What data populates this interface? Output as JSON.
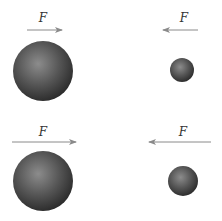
{
  "diagram": {
    "force_label": "F",
    "colors": {
      "background": "#ffffff",
      "arrow": "#8a8a8a",
      "label": "#333333",
      "sphere_light": "#8c8c8c",
      "sphere_mid": "#555555",
      "sphere_dark": "#2a2a2a"
    },
    "panels": [
      {
        "id": "top-left",
        "label": "F",
        "arrow": {
          "x1": 27,
          "x2": 62,
          "y": 30,
          "direction": "right"
        },
        "label_pos": {
          "x": 43,
          "y": 22
        },
        "sphere": {
          "cx": 43,
          "cy": 71,
          "r": 30,
          "size": "large"
        }
      },
      {
        "id": "top-right",
        "label": "F",
        "arrow": {
          "x1": 198,
          "x2": 163,
          "y": 30,
          "direction": "left"
        },
        "label_pos": {
          "x": 183,
          "y": 22
        },
        "sphere": {
          "cx": 182,
          "cy": 70,
          "r": 12,
          "size": "small"
        }
      },
      {
        "id": "bottom-left",
        "label": "F",
        "arrow": {
          "x1": 12,
          "x2": 76,
          "y": 142,
          "direction": "right"
        },
        "label_pos": {
          "x": 43,
          "y": 136
        },
        "sphere": {
          "cx": 43,
          "cy": 181,
          "r": 30,
          "size": "large"
        }
      },
      {
        "id": "bottom-right",
        "label": "F",
        "arrow": {
          "x1": 211,
          "x2": 149,
          "y": 142,
          "direction": "left"
        },
        "label_pos": {
          "x": 183,
          "y": 136
        },
        "sphere": {
          "cx": 183,
          "cy": 181,
          "r": 15,
          "size": "medium-small"
        }
      }
    ]
  }
}
